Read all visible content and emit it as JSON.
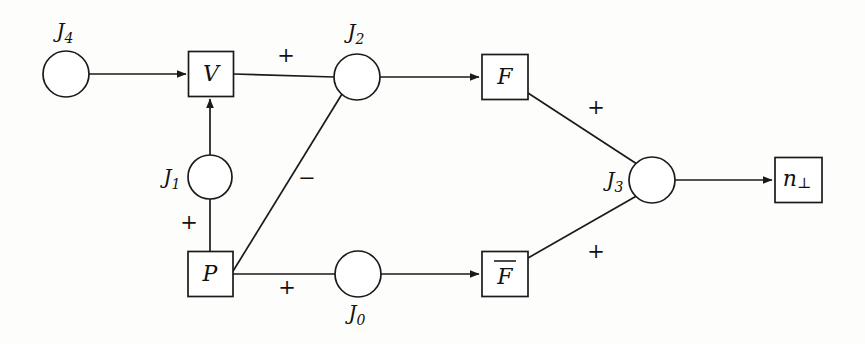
{
  "diagram": {
    "background_color": "#fdfdfb",
    "line_color": "#1a1a1a",
    "nodes": [
      {
        "id": "J4",
        "kind": "circle",
        "label": "J",
        "subscript": "4",
        "label_position": "above",
        "cx": 66,
        "cy": 74,
        "r": 23
      },
      {
        "id": "V",
        "kind": "box",
        "label": "V",
        "cx": 211,
        "cy": 74,
        "w": 45,
        "h": 45
      },
      {
        "id": "J2",
        "kind": "circle",
        "label": "J",
        "subscript": "2",
        "label_position": "above",
        "cx": 357,
        "cy": 77,
        "r": 23
      },
      {
        "id": "F",
        "kind": "box",
        "label": "F",
        "cx": 505,
        "cy": 77,
        "w": 46,
        "h": 45
      },
      {
        "id": "J1",
        "kind": "circle",
        "label": "J",
        "subscript": "1",
        "label_position": "left",
        "cx": 210,
        "cy": 177,
        "r": 22
      },
      {
        "id": "J3",
        "kind": "circle",
        "label": "J",
        "subscript": "3",
        "label_position": "left",
        "cx": 652,
        "cy": 180,
        "r": 23
      },
      {
        "id": "nperp",
        "kind": "box",
        "label": "n",
        "subscript": "⊥",
        "cx": 798,
        "cy": 180,
        "w": 47,
        "h": 45
      },
      {
        "id": "P",
        "kind": "box",
        "label": "P",
        "cx": 210,
        "cy": 274,
        "w": 45,
        "h": 45
      },
      {
        "id": "J0",
        "kind": "circle",
        "label": "J",
        "subscript": "0",
        "label_position": "below",
        "cx": 358,
        "cy": 274,
        "r": 23
      },
      {
        "id": "Fbar",
        "kind": "box",
        "label": "F",
        "overbar": true,
        "cx": 505,
        "cy": 274,
        "w": 46,
        "h": 45
      }
    ],
    "edges": [
      {
        "id": "J4-to-V",
        "from": "J4",
        "to": "V",
        "arrow": true,
        "sign": ""
      },
      {
        "id": "V-to-J2",
        "from": "V",
        "to": "J2",
        "arrow": false,
        "sign": "+"
      },
      {
        "id": "J2-to-F",
        "from": "J2",
        "to": "F",
        "arrow": true,
        "sign": ""
      },
      {
        "id": "J1-to-V",
        "from": "J1",
        "to": "V",
        "arrow": true,
        "sign": ""
      },
      {
        "id": "P-to-J1",
        "from": "P",
        "to": "J1",
        "arrow": false,
        "sign": "+"
      },
      {
        "id": "P-to-J2",
        "from": "P",
        "to": "J2",
        "arrow": false,
        "sign": "−"
      },
      {
        "id": "P-to-J0",
        "from": "P",
        "to": "J0",
        "arrow": false,
        "sign": "+"
      },
      {
        "id": "J0-to-Fbar",
        "from": "J0",
        "to": "Fbar",
        "arrow": true,
        "sign": ""
      },
      {
        "id": "F-to-J3",
        "from": "F",
        "to": "J3",
        "arrow": false,
        "sign": "+"
      },
      {
        "id": "Fbar-to-J3",
        "from": "Fbar",
        "to": "J3",
        "arrow": false,
        "sign": "+"
      },
      {
        "id": "J3-to-nperp",
        "from": "J3",
        "to": "nperp",
        "arrow": true,
        "sign": ""
      }
    ],
    "labels": {
      "J4": "J",
      "J4_sub": "4",
      "J2": "J",
      "J2_sub": "2",
      "J1": "J",
      "J1_sub": "1",
      "J0": "J",
      "J0_sub": "0",
      "J3": "J",
      "J3_sub": "3",
      "V": "V",
      "P": "P",
      "F": "F",
      "Fbar": "F",
      "n": "n",
      "n_sub": "⊥",
      "sign_plus_v_j2": "+",
      "sign_minus_p_j2": "−",
      "sign_plus_p_j1": "+",
      "sign_plus_p_j0": "+",
      "sign_plus_f_j3": "+",
      "sign_plus_fbar_j3": "+"
    }
  }
}
